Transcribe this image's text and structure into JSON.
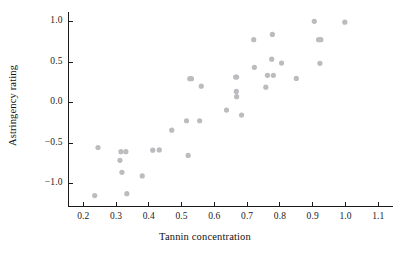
{
  "chart_data": {
    "type": "scatter",
    "title": "",
    "xlabel": "Tannin concentration",
    "ylabel": "Astringency rating",
    "xlim": [
      0.155,
      1.145
    ],
    "ylim": [
      -1.28,
      1.12
    ],
    "xticks": [
      0.2,
      0.3,
      0.4,
      0.5,
      0.6,
      0.7,
      0.8,
      0.9,
      1.0,
      1.1
    ],
    "yticks": [
      -1.0,
      -0.5,
      0.0,
      0.5,
      1.0
    ],
    "xticklabels": [
      "0.2",
      "0.3",
      "0.4",
      "0.5",
      "0.6",
      "0.7",
      "0.8",
      "0.9",
      "1.0",
      "1.1"
    ],
    "yticklabels": [
      "-1.0",
      "-0.5",
      "0.0",
      "0.5",
      "1.0"
    ],
    "grid": false,
    "legend": null,
    "marker_color": "#bcbcc0",
    "marker_size": 4,
    "series": [
      {
        "name": "wine samples",
        "x": [
          0.235,
          0.245,
          0.312,
          0.315,
          0.318,
          0.33,
          0.333,
          0.38,
          0.412,
          0.432,
          0.47,
          0.515,
          0.52,
          0.525,
          0.555,
          0.56,
          0.637,
          0.665,
          0.667,
          0.668,
          0.683,
          0.72,
          0.722,
          0.757,
          0.762,
          0.775,
          0.777,
          0.78,
          0.805,
          0.85,
          0.905,
          0.918,
          0.922,
          0.925,
          0.998,
          0.53,
          0.668
        ],
        "y": [
          -1.145,
          -0.552,
          -0.71,
          -0.603,
          -0.858,
          -0.603,
          -1.122,
          -0.903,
          -0.585,
          -0.582,
          -0.338,
          -0.222,
          -0.65,
          0.297,
          -0.222,
          0.205,
          -0.09,
          0.318,
          0.14,
          0.075,
          -0.152,
          0.778,
          0.437,
          0.192,
          0.338,
          0.538,
          0.843,
          0.338,
          0.49,
          0.3,
          1.005,
          0.778,
          0.487,
          0.778,
          0.995,
          0.297,
          0.318
        ]
      }
    ]
  },
  "axis": {
    "x_axis_name": "x-axis",
    "y_axis_name": "y-axis"
  }
}
